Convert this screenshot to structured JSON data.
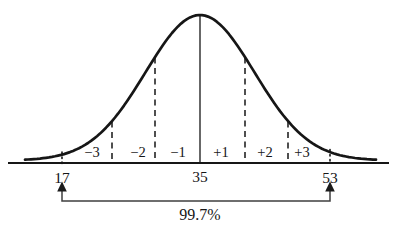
{
  "diagram": {
    "kind": "normal-distribution-empirical-rule",
    "sd_labels": [
      "−3",
      "−2",
      "−1",
      "+1",
      "+2",
      "+3"
    ],
    "axis_values": {
      "low": "17",
      "mean": "35",
      "high": "53"
    },
    "range_label": "99.7%",
    "colors": {
      "ink": "#161616",
      "bracket": "#3f3f3f",
      "background": "#ffffff"
    }
  }
}
